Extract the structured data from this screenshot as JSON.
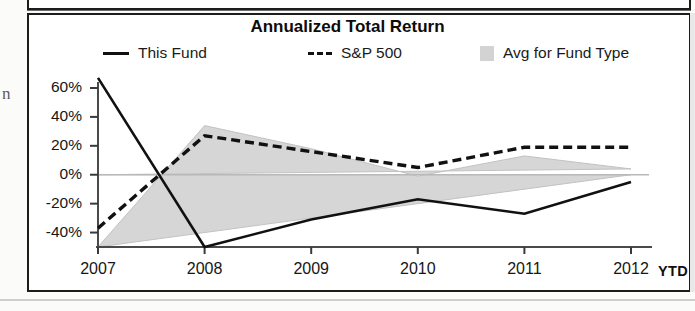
{
  "page": {
    "margin_letter": "n"
  },
  "chart_data": {
    "type": "line",
    "title": "Annualized Total Return",
    "xlabel": "",
    "ylabel": "",
    "categories": [
      "2007",
      "2008",
      "2009",
      "2010",
      "2011",
      "2012"
    ],
    "x_axis_suffix": "YTD",
    "ytick_labels": [
      "60%",
      "40%",
      "20%",
      "0%",
      "-20%",
      "-40%"
    ],
    "ytick_values": [
      60,
      40,
      20,
      0,
      -20,
      -40
    ],
    "ylim": [
      -50,
      68
    ],
    "grid": false,
    "legend_position": "top",
    "series": [
      {
        "name": "This Fund",
        "style": "solid-line",
        "color": "#111111",
        "values": [
          67,
          -50,
          -31,
          -17,
          -27,
          -5
        ]
      },
      {
        "name": "S&P 500",
        "style": "dashed-line",
        "color": "#111111",
        "values": [
          -37,
          27,
          16,
          5,
          19,
          19
        ]
      },
      {
        "name": "Avg for Fund Type",
        "style": "filled-area",
        "color": "#d3d3d3",
        "values": [
          -50,
          34,
          18,
          -1,
          13,
          4
        ]
      }
    ]
  },
  "legend": {
    "items": [
      {
        "label": "This Fund",
        "marker": "solid-line-swatch"
      },
      {
        "label": "S&P 500",
        "marker": "dashed-line-swatch"
      },
      {
        "label": "Avg for Fund Type",
        "marker": "area-swatch"
      }
    ]
  }
}
